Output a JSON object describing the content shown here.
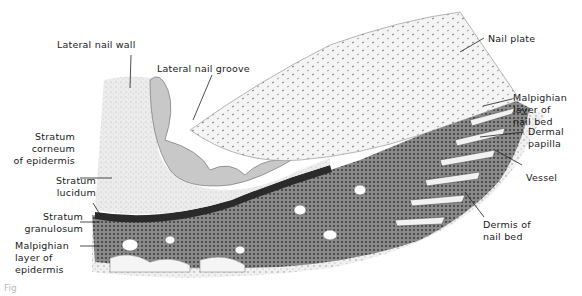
{
  "figure": {
    "caption_partial": "Fig"
  },
  "labels": {
    "lateral_nail_wall": "Lateral nail wall",
    "lateral_nail_groove": "Lateral nail groove",
    "nail_plate": "Nail plate",
    "malpighian_nail_bed": "Malpighian\nlayer of\nnail bed",
    "dermal_papilla": "Dermal\npapilla",
    "vessel": "Vessel",
    "dermis_nail_bed": "Dermis of\nnail bed",
    "stratum_corneum": "Stratum\ncorneum\nof epidermis",
    "stratum_lucidum": "Stratum\nlucidum",
    "stratum_granulosum": "Stratum\ngranulosum",
    "malpighian_epidermis": "Malpighian\nlayer of\nepidermis"
  },
  "colors": {
    "background": "#ffffff",
    "ink": "#1a1a1a",
    "stratum_corneum": "#e6e6e6",
    "nail_plate": "#f2f2f2",
    "malpighian": "#6e6e6e",
    "malpighian_dark": "#4a4a4a",
    "dermis": "#d9d9d9",
    "granulosum": "#2a2a2a"
  }
}
